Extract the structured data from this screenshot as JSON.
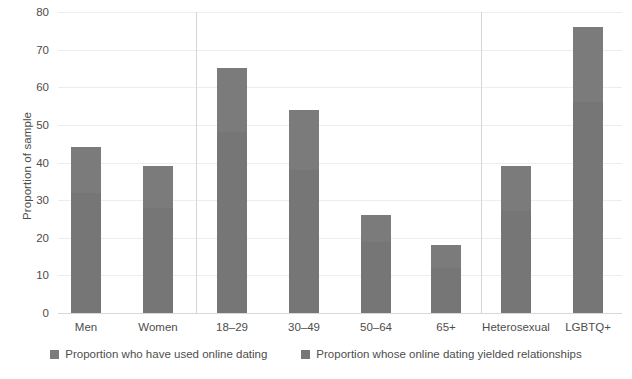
{
  "chart_data": {
    "type": "bar",
    "title": "",
    "subtitle": "",
    "xlabel": "",
    "ylabel": "Proportion of sample",
    "ylim": [
      0,
      80
    ],
    "yticks": [
      0,
      10,
      20,
      30,
      40,
      50,
      60,
      70,
      80
    ],
    "grid": true,
    "legend_position": "bottom",
    "categories": [
      "Men",
      "Women",
      "18–29",
      "30–49",
      "50–64",
      "65+",
      "Heterosexual",
      "LGBTQ+"
    ],
    "groups": [
      {
        "name": "Gender",
        "categories": [
          "Men",
          "Women"
        ]
      },
      {
        "name": "Age",
        "categories": [
          "18–29",
          "30–49",
          "50–64",
          "65+"
        ]
      },
      {
        "name": "Orientation",
        "categories": [
          "Heterosexual",
          "LGBTQ+"
        ]
      }
    ],
    "series": [
      {
        "name": "Proportion who have used online dating",
        "color": "#7b7b7b",
        "values": [
          44,
          39,
          65,
          54,
          26,
          18,
          39,
          76
        ]
      },
      {
        "name": "Proportion whose online dating yielded relationships",
        "color": "#767676",
        "values": [
          32,
          28,
          48,
          38,
          19,
          12,
          27,
          56
        ]
      }
    ]
  },
  "axis": {
    "y_title": "Proportion of sample",
    "y_tick_labels": [
      "0",
      "10",
      "20",
      "30",
      "40",
      "50",
      "60",
      "70",
      "80"
    ],
    "x_tick_labels": [
      "Men",
      "Women",
      "18–29",
      "30–49",
      "50–64",
      "65+",
      "Heterosexual",
      "LGBTQ+"
    ]
  },
  "legend": {
    "items": [
      {
        "label": "Proportion who have used online dating",
        "color": "#7b7b7b"
      },
      {
        "label": "Proportion whose online dating yielded relationships",
        "color": "#767676"
      }
    ]
  },
  "colors": {
    "bar_upper": "#7b7b7b",
    "bar_lower": "#767676",
    "gridline": "#ededf0",
    "axis_text": "#4d4d4d",
    "divider": "#d5d5d9",
    "background": "#ffffff"
  }
}
